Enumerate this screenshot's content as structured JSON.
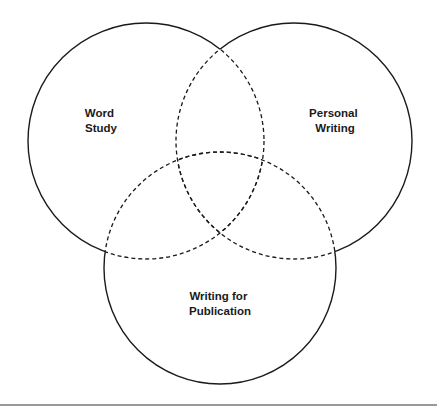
{
  "diagram": {
    "type": "venn",
    "circles": [
      {
        "id": "word-study",
        "label_lines": [
          "Word",
          "Study"
        ],
        "cx": 146,
        "cy": 141,
        "r": 118
      },
      {
        "id": "personal-writing",
        "label_lines": [
          "Personal",
          "Writing"
        ],
        "cx": 294,
        "cy": 141,
        "r": 118
      },
      {
        "id": "writing-for-publication",
        "label_lines": [
          "Writing for",
          "Publication"
        ],
        "cx": 220,
        "cy": 268,
        "r": 116
      }
    ],
    "colors": {
      "stroke": "#1a1a1a",
      "rule": "#777777"
    }
  }
}
